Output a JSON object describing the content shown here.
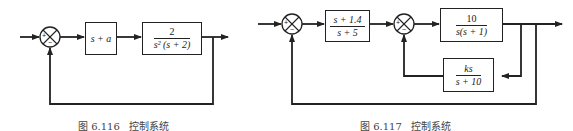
{
  "figures": [
    {
      "caption": "图 6.116   控制系统",
      "blocks": [
        {
          "id": "controller",
          "text": "s + a"
        },
        {
          "id": "plant",
          "numerator": "2",
          "denominator": "s² (s + 2)"
        }
      ],
      "summing_junction": {
        "plus": "+",
        "minus": "−"
      }
    },
    {
      "caption": "图 6.117   控制系统",
      "blocks": [
        {
          "id": "compensator",
          "numerator": "s + 1.4",
          "denominator": "s + 5"
        },
        {
          "id": "plant",
          "numerator": "10",
          "denominator": "s(s + 1)"
        },
        {
          "id": "rate-feedback",
          "numerator": "ks",
          "denominator": "s + 10"
        }
      ],
      "summing_junctions": [
        {
          "plus": "+",
          "minus": "−"
        },
        {
          "plus": "+",
          "minus": "−"
        }
      ]
    }
  ]
}
